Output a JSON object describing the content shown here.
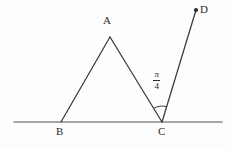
{
  "figure": {
    "type": "geometry-diagram",
    "width": 230,
    "height": 149,
    "background_color": "#fdfdfd",
    "stroke_color": "#3a3a3a",
    "baseline_color": "#8a8a8a",
    "label_color": "#2b2b2b"
  },
  "points": {
    "A": {
      "label": "A",
      "x": 110,
      "y": 37
    },
    "B": {
      "label": "B",
      "x": 61,
      "y": 122
    },
    "C": {
      "label": "C",
      "x": 162,
      "y": 122
    },
    "D": {
      "label": "D",
      "x": 196,
      "y": 10
    }
  },
  "baseline": {
    "name": "horizontal-line",
    "x1": 14,
    "y1": 122,
    "x2": 222,
    "y2": 122
  },
  "segments": [
    {
      "name": "segment-BA",
      "from": "B",
      "to": "A"
    },
    {
      "name": "segment-AC",
      "from": "A",
      "to": "C"
    },
    {
      "name": "ray-CD",
      "from": "C",
      "to": "D"
    }
  ],
  "markers": [
    {
      "name": "point-D-dot",
      "at": "D",
      "style": "filled-circle",
      "radius": 2.1
    }
  ],
  "angle": {
    "name": "angle-ACD",
    "vertex": "C",
    "between": [
      "CA",
      "CD"
    ],
    "numerator": "π",
    "denominator": "4",
    "label": "π/4",
    "arc_radius": 16
  }
}
